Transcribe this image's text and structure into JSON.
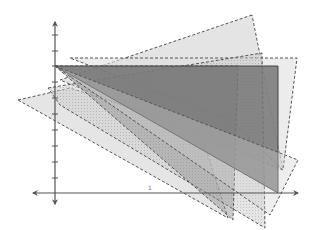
{
  "diagram": {
    "title": "",
    "background": "#ffffff",
    "axes": {
      "color": "#555555",
      "origin_px": [
        55,
        193
      ],
      "x_axis": {
        "from": [
          33,
          193
        ],
        "to": [
          298,
          193
        ]
      },
      "y_axis": {
        "from": [
          55,
          204
        ],
        "to": [
          55,
          22
        ]
      },
      "y_ticks_px": [
        35,
        51,
        66,
        82,
        98,
        114,
        130,
        146,
        162,
        178
      ],
      "x_tick_label": {
        "text": "1",
        "pos": [
          148,
          190
        ]
      }
    },
    "shapes": [
      {
        "name": "light-quad-left",
        "points": "18,100 70,88 200,130 228,218",
        "fill": "#dcdcdc",
        "opacity": 0.75,
        "stroke": "#555555",
        "dashed": true
      },
      {
        "name": "light-triangle-apex-top",
        "points": "252,15 60,80 283,170",
        "fill": "#d8d8d8",
        "opacity": 0.7,
        "stroke": "#555555",
        "dashed": true
      },
      {
        "name": "light-band-top",
        "points": "70,58 297,58 283,170 230,120",
        "fill": "#e0e0e0",
        "opacity": 0.6,
        "stroke": "#555555",
        "dashed": true
      },
      {
        "name": "hatched-wedge",
        "points": "48,88 262,53 265,228 60,105",
        "fill": "#bdbdbd",
        "opacity": 0.55,
        "stroke": "#555555",
        "dashed": true
      },
      {
        "name": "medium-triangle",
        "points": "55,66 238,66 233,220",
        "fill": "#8c8c8c",
        "opacity": 0.45,
        "stroke": "#555555",
        "dashed": true
      },
      {
        "name": "dark-triangle",
        "points": "55,66 278,66 278,193",
        "fill": "#777777",
        "opacity": 0.85,
        "stroke": "#444444",
        "dashed": false
      },
      {
        "name": "wedge-lower-right",
        "points": "55,66 270,215 298,160",
        "fill": "#cfcfcf",
        "opacity": 0.35,
        "stroke": "#555555",
        "dashed": true
      }
    ]
  }
}
